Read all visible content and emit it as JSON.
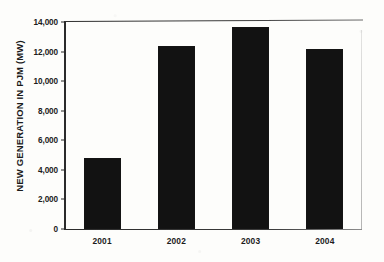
{
  "chart_data": {
    "type": "bar",
    "title": "",
    "xlabel": "",
    "ylabel": "NEW GENERATION IN PJM (MW)",
    "categories": [
      "2001",
      "2002",
      "2003",
      "2004"
    ],
    "values": [
      4800,
      12400,
      13650,
      12150
    ],
    "ylim": [
      0,
      14000
    ],
    "ytick_values": [
      0,
      2000,
      4000,
      6000,
      8000,
      10000,
      12000,
      14000
    ],
    "ytick_labels": [
      "0",
      "2,000",
      "4,000",
      "6,000",
      "8,000",
      "10,000",
      "12,000",
      "14,000"
    ],
    "grid": false,
    "legend": null,
    "bar_color": "#121212",
    "background_color": "#fdfdfb",
    "axis_color": "#2b2b2b"
  }
}
